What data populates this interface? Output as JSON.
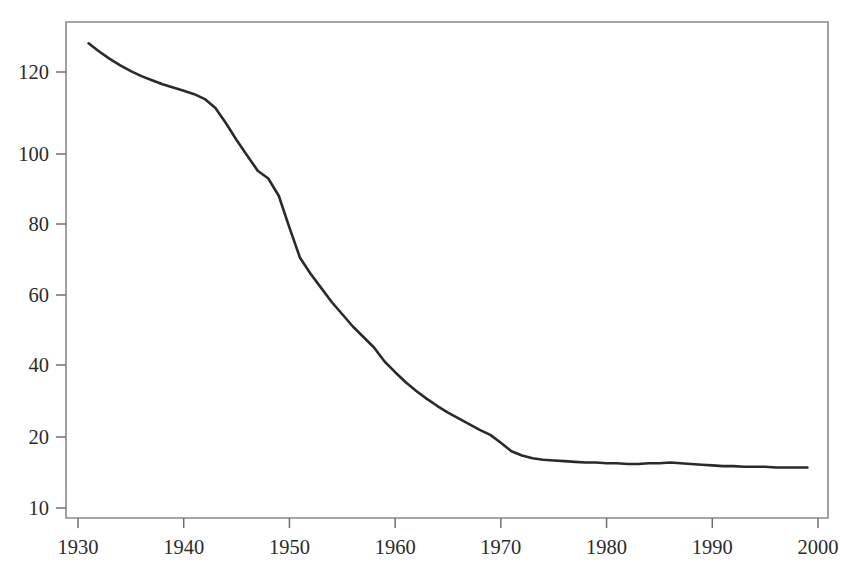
{
  "page": {
    "background_color": "#ffffff",
    "width": 860,
    "height": 576
  },
  "figure": {
    "cropped_title_fragment": "",
    "frame_color": "#8a8a8a",
    "line_color": "#2a2a2a",
    "text_color": "#2b2b2b"
  },
  "chart_data": {
    "type": "line",
    "title": "",
    "subtitle": "",
    "xlabel": "",
    "ylabel": "",
    "grid": false,
    "legend": null,
    "legend_position": "none",
    "xlim": [
      1930,
      2000
    ],
    "ylim": [
      10,
      133
    ],
    "xtick_labels": [
      "1930",
      "1940",
      "1950",
      "1960",
      "1970",
      "1980",
      "1990",
      "2000"
    ],
    "xticks": [
      1930,
      1940,
      1950,
      1960,
      1970,
      1980,
      1990,
      2000
    ],
    "ytick_labels": [
      "120",
      "100",
      "80",
      "60",
      "40",
      "20",
      "10"
    ],
    "yticks": [
      120,
      100,
      80,
      60,
      40,
      20,
      10
    ],
    "y_axis_note": "tick spacing between 10 and 20 is wider than a strict linear 20-unit step; axis is effectively compressed below 20",
    "series": [
      {
        "name": "series-1",
        "color": "#2a2a2a",
        "line_width": 2.6,
        "x": [
          1931,
          1932,
          1933,
          1934,
          1935,
          1936,
          1937,
          1938,
          1939,
          1940,
          1941,
          1942,
          1943,
          1944,
          1945,
          1946,
          1947,
          1948,
          1949,
          1950,
          1951,
          1952,
          1953,
          1954,
          1955,
          1956,
          1957,
          1958,
          1959,
          1960,
          1961,
          1962,
          1963,
          1964,
          1965,
          1966,
          1967,
          1968,
          1969,
          1970,
          1971,
          1972,
          1973,
          1974,
          1975,
          1976,
          1977,
          1978,
          1979,
          1980,
          1981,
          1982,
          1983,
          1984,
          1985,
          1986,
          1987,
          1988,
          1989,
          1990,
          1991,
          1992,
          1993,
          1994,
          1995,
          1996,
          1997,
          1998,
          1999
        ],
        "values": [
          127.0,
          125.0,
          123.2,
          121.6,
          120.2,
          119.0,
          118.0,
          117.0,
          116.2,
          115.4,
          114.6,
          113.4,
          111.2,
          107.5,
          103.4,
          99.6,
          95.2,
          93.0,
          88.0,
          79.0,
          70.5,
          66.0,
          62.0,
          58.0,
          54.5,
          51.0,
          48.0,
          45.0,
          41.0,
          38.0,
          35.2,
          32.8,
          30.6,
          28.6,
          26.8,
          25.2,
          23.6,
          22.0,
          20.6,
          19.2,
          18.0,
          17.4,
          17.0,
          16.8,
          16.7,
          16.6,
          16.5,
          16.4,
          16.4,
          16.3,
          16.3,
          16.2,
          16.2,
          16.3,
          16.3,
          16.4,
          16.3,
          16.2,
          16.1,
          16.0,
          15.9,
          15.9,
          15.8,
          15.8,
          15.8,
          15.7,
          15.7,
          15.7,
          15.7
        ]
      }
    ]
  }
}
